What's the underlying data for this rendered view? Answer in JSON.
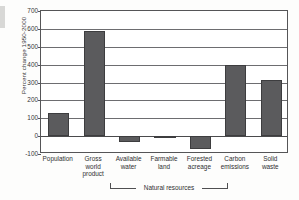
{
  "chart_data": {
    "type": "bar",
    "title": "",
    "subtitle": "",
    "xlabel": "",
    "ylabel": "Percent change 1950-2000",
    "categories": [
      "Population",
      "Gross world product",
      "Available water",
      "Farmable land",
      "Forested acreage",
      "Carbon emissions",
      "Solid waste"
    ],
    "category_lines": [
      [
        "Population"
      ],
      [
        "Gross",
        "world",
        "product"
      ],
      [
        "Available",
        "water"
      ],
      [
        "Farmable",
        "land"
      ],
      [
        "Forested",
        "acreage"
      ],
      [
        "Carbon",
        "emissions"
      ],
      [
        "Solid",
        "waste"
      ]
    ],
    "values": [
      130,
      590,
      -33,
      -10,
      -70,
      400,
      315
    ],
    "ylim": [
      -100,
      700
    ],
    "yticks": [
      700,
      600,
      500,
      400,
      300,
      200,
      100,
      0,
      -100
    ],
    "ytick_labels": [
      "700",
      "600",
      "500",
      "400",
      "300",
      "200",
      "100",
      "0",
      "-100"
    ],
    "grid": true,
    "legend": "none",
    "bar_color": "#5b5b5d",
    "annotations": [
      {
        "text": "Natural resources",
        "covers": [
          "Available water",
          "Farmable land",
          "Forested acreage"
        ]
      }
    ]
  },
  "group_bracket": {
    "label": "Natural resources"
  },
  "colors": {
    "bar": "#5b5b5d",
    "bar_edge": "#3d3d3f",
    "axis": "#555557",
    "grid": "#6d6d70",
    "text": "#2f2f31",
    "background": "#ffffff"
  }
}
